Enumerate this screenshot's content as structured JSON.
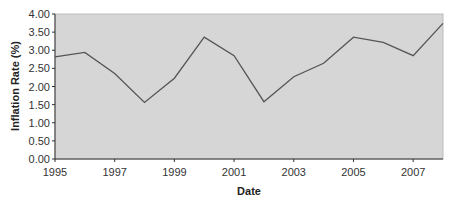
{
  "chart_data": {
    "type": "line",
    "title": "",
    "xlabel": "Date",
    "ylabel": "Inflation Rate (%)",
    "x": [
      1995,
      1996,
      1997,
      1998,
      1999,
      2000,
      2001,
      2002,
      2003,
      2004,
      2005,
      2006,
      2007,
      2008
    ],
    "series": [
      {
        "name": "Inflation Rate",
        "values": [
          2.82,
          2.94,
          2.36,
          1.56,
          2.23,
          3.36,
          2.85,
          1.58,
          2.27,
          2.64,
          3.36,
          3.22,
          2.85,
          3.74
        ]
      }
    ],
    "xticks": [
      "1995",
      "1997",
      "1999",
      "2001",
      "2003",
      "2005",
      "2007"
    ],
    "yticks": [
      "0.00",
      "0.50",
      "1.00",
      "1.50",
      "2.00",
      "2.50",
      "3.00",
      "3.50",
      "4.00"
    ],
    "xlim": [
      1995,
      2008
    ],
    "ylim": [
      0,
      4
    ],
    "grid": false,
    "legend": null,
    "colors": {
      "plot_background": "#d6d6d6",
      "plot_border": "#bdbdbd",
      "line": "#555555",
      "axis": "#333333"
    }
  }
}
